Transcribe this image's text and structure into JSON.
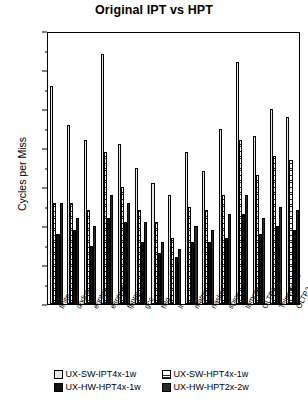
{
  "chart_data": {
    "type": "bar",
    "title": "Original IPT vs HPT",
    "xlabel": "",
    "ylabel": "Cycles per Miss",
    "ylim": [
      0,
      70
    ],
    "ytick_step": 10,
    "yticks": [
      0,
      10,
      20,
      30,
      40,
      50,
      60,
      70
    ],
    "grid": false,
    "legend_position": "bottom",
    "categories": [
      "finite",
      "doduc",
      "eqntott",
      "espresso",
      "fpppp",
      "gcc",
      "hilo",
      "li",
      "matrix",
      "nasker",
      "spice",
      "tomcatv",
      "OLTP1-ux",
      "Telecom-ux",
      "OLTP2-ux"
    ],
    "series": [
      {
        "name": "UX-SW-IPT4x-1w",
        "pattern": "light-checker",
        "values": [
          56,
          46,
          42,
          64,
          41,
          35,
          31,
          28,
          39,
          34,
          45,
          62,
          43,
          50,
          48
        ]
      },
      {
        "name": "UX-SW-HPT4x-1w",
        "pattern": "horizontal-lines",
        "values": [
          26,
          26,
          24,
          39,
          30,
          24,
          21,
          17,
          25,
          24,
          28,
          42,
          33,
          38,
          37
        ]
      },
      {
        "name": "UX-HW-HPT4x-1w",
        "pattern": "solid-black",
        "values": [
          18,
          19,
          15,
          22,
          21,
          16,
          13,
          12,
          16,
          16,
          17,
          23,
          18,
          20,
          19
        ]
      },
      {
        "name": "UX-HW-HPT2x-2w",
        "pattern": "dark-checker",
        "values": [
          26,
          22,
          20,
          28,
          26,
          21,
          16,
          14,
          20,
          19,
          23,
          28,
          22,
          25,
          24
        ]
      }
    ]
  },
  "legend": {
    "entries": [
      {
        "label": "UX-SW-IPT4x-1w"
      },
      {
        "label": "UX-SW-HPT4x-1w"
      },
      {
        "label": "UX-HW-HPT4x-1w"
      },
      {
        "label": "UX-HW-HPT2x-2w"
      }
    ]
  }
}
